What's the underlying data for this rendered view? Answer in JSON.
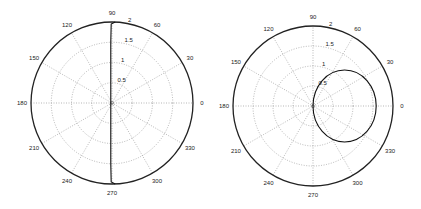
{
  "chart_data": [
    {
      "type": "polar",
      "title": "",
      "center_px": [
        112,
        103
      ],
      "radius_px": 81,
      "rmax": 2,
      "radial_ticks": [
        0.5,
        1,
        1.5,
        2
      ],
      "radial_tick_labels": [
        "0.5",
        "1",
        "1.5",
        "2"
      ],
      "angular_ticks_deg": [
        0,
        30,
        60,
        90,
        120,
        150,
        180,
        210,
        240,
        270,
        300,
        330
      ],
      "angular_tick_labels": [
        "0",
        "30",
        "60",
        "90",
        "120",
        "150",
        "180",
        "210",
        "240",
        "270",
        "300",
        "330"
      ],
      "grid": true,
      "series": [
        {
          "name": "curve",
          "description": "near-vertical line slightly left of origin, x ≈ -0.03, spanning r up to 2 at θ≈90° and θ≈270°, bending right along outer ring at both ends",
          "points_xy": [
            [
              0.08,
              1.998
            ],
            [
              -0.02,
              1.95
            ],
            [
              -0.03,
              1.5
            ],
            [
              -0.03,
              1.0
            ],
            [
              -0.03,
              0.5
            ],
            [
              -0.03,
              0.0
            ],
            [
              -0.03,
              -0.5
            ],
            [
              -0.03,
              -1.0
            ],
            [
              -0.03,
              -1.5
            ],
            [
              -0.02,
              -1.95
            ],
            [
              0.08,
              -1.998
            ]
          ]
        }
      ]
    },
    {
      "type": "polar",
      "title": "",
      "center_px": [
        313,
        106
      ],
      "radius_px": 80,
      "rmax": 2,
      "radial_ticks": [
        0.5,
        1,
        1.5,
        2
      ],
      "radial_tick_labels": [
        "0.5",
        "1",
        "1.5",
        "2"
      ],
      "angular_ticks_deg": [
        0,
        30,
        60,
        90,
        120,
        150,
        180,
        210,
        240,
        270,
        300,
        330
      ],
      "angular_tick_labels": [
        "0",
        "30",
        "60",
        "90",
        "120",
        "150",
        "180",
        "210",
        "240",
        "270",
        "300",
        "330"
      ],
      "grid": true,
      "series": [
        {
          "name": "curve",
          "description": "closed loop through the origin, approx r = 1.58·cos(θ) (slightly taller than wide)",
          "ellipse": {
            "cx": 0.79,
            "cy": 0.0,
            "rx": 0.79,
            "ry": 0.9
          }
        }
      ]
    }
  ]
}
